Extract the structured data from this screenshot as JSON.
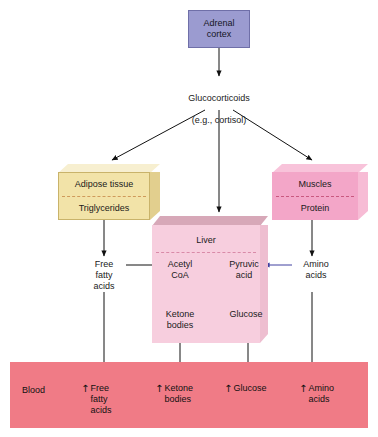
{
  "diagram": {
    "colors": {
      "adrenal": "#9b9bd0",
      "adipose": "#f2e3a8",
      "liver": "#f7cede",
      "muscle": "#f3a6c8",
      "blood": "#f07b86",
      "arrow": "#111111",
      "blue_arrow": "#4040a0"
    }
  },
  "source": {
    "label": "Adrenal\ncortex"
  },
  "hormone": {
    "line1": "Glucocorticoids",
    "line2": "(e.g., cortisol)"
  },
  "organs": {
    "adipose": {
      "title": "Adipose tissue",
      "substrate": "Triglycerides"
    },
    "liver": {
      "title": "Liver",
      "metabolites": [
        {
          "name": "Acetyl\nCoA",
          "product": "Ketone\nbodies"
        },
        {
          "name": "Pyruvic\nacid",
          "product": "Glucose"
        }
      ]
    },
    "muscle": {
      "title": "Muscles",
      "substrate": "Protein"
    }
  },
  "intermediates": {
    "free_fatty_acids": "Free\nfatty\nacids",
    "amino_acids": "Amino\nacids"
  },
  "blood": {
    "label": "Blood",
    "items": [
      {
        "arrow": "↑",
        "text": "Free\nfatty\nacids"
      },
      {
        "arrow": "↑",
        "text": "Ketone\nbodies"
      },
      {
        "arrow": "↑",
        "text": "Glucose"
      },
      {
        "arrow": "↑",
        "text": "Amino\nacids"
      }
    ]
  }
}
